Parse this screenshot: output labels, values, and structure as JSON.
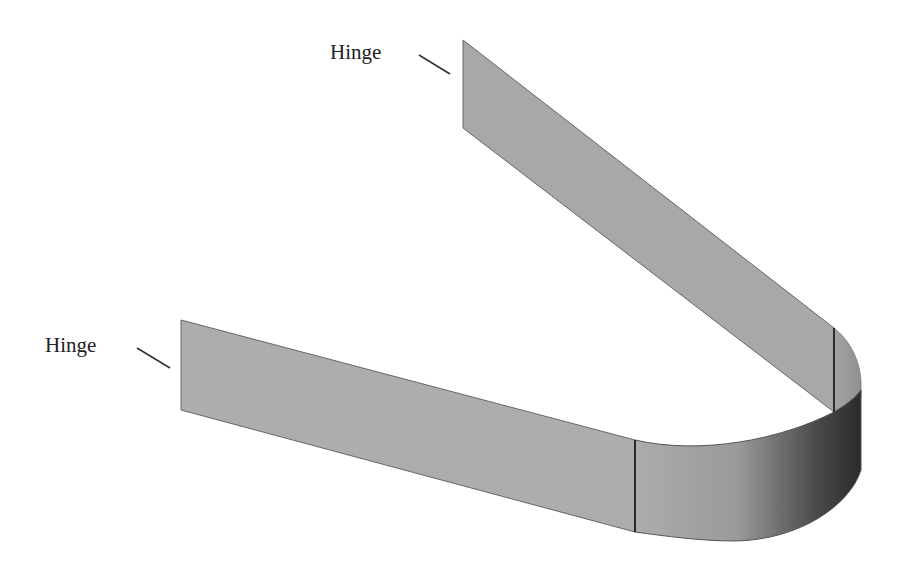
{
  "diagram": {
    "labels": [
      {
        "id": "hinge-top",
        "text": "Hinge"
      },
      {
        "id": "hinge-left",
        "text": "Hinge"
      }
    ],
    "colors": {
      "strip_fill": "#a9a9a9",
      "strip_edge": "#555555",
      "curve_dark": "#2e2e2e",
      "seam_line": "#222222",
      "background": "#ffffff"
    }
  }
}
